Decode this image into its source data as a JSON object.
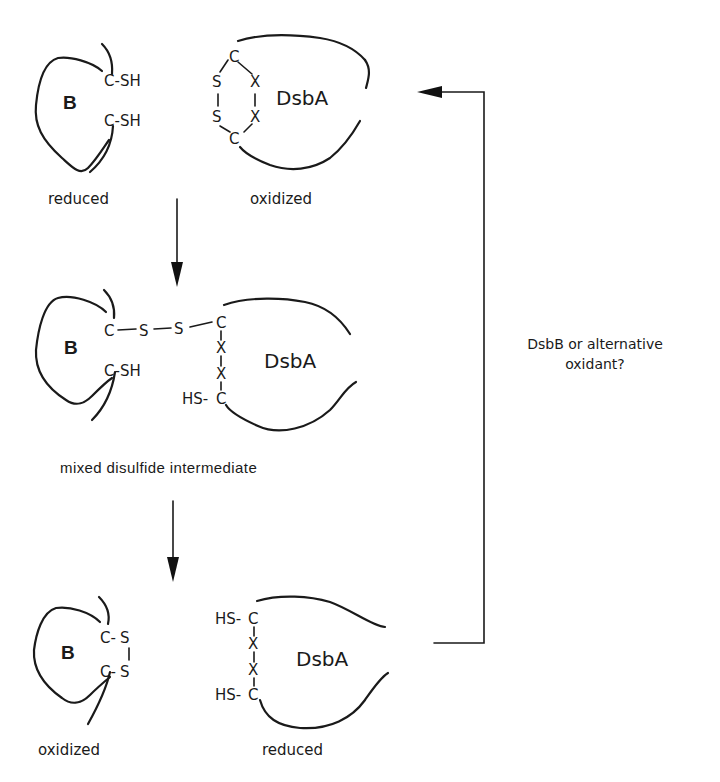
{
  "figure": {
    "type": "reaction-cycle",
    "colors": {
      "ink": "#1a1a1a",
      "background": "#ffffff"
    }
  },
  "stage1": {
    "protein_b": {
      "name": "B",
      "groups": [
        "C-SH",
        "C-SH"
      ],
      "state": "reduced"
    },
    "dsba": {
      "name": "DsbA",
      "state": "oxidized",
      "active_site": {
        "top": "C",
        "left_upper": "S",
        "left_lower": "S",
        "right_upper": "X",
        "right_lower": "X",
        "bottom": "C"
      }
    }
  },
  "stage2": {
    "protein_b": {
      "name": "B",
      "bridge": [
        "C",
        "S",
        "S"
      ],
      "free_group": "C-SH"
    },
    "dsba": {
      "name": "DsbA",
      "chain": [
        "C",
        "X",
        "X",
        "C"
      ],
      "free_group": "HS-"
    },
    "label": "mixed disulfide intermediate"
  },
  "stage3": {
    "protein_b": {
      "name": "B",
      "groups": [
        "C-",
        "C-"
      ],
      "sulfurs": [
        "S",
        "S"
      ],
      "state": "oxidized"
    },
    "dsba": {
      "name": "DsbA",
      "chain": [
        "C",
        "X",
        "X",
        "C"
      ],
      "free_groups": [
        "HS-",
        "HS-"
      ],
      "state": "reduced"
    }
  },
  "arrows": {
    "step1": {
      "direction": "down"
    },
    "step2": {
      "direction": "down"
    },
    "regeneration": {
      "direction": "left",
      "label_line1": "DsbB or alternative",
      "label_line2": "oxidant?"
    }
  }
}
